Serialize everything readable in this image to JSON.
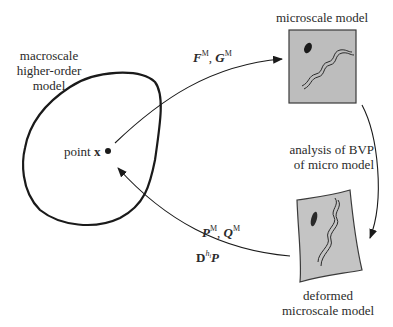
{
  "diagram": {
    "macro": {
      "label_lines": [
        "macroscale",
        "higher-order",
        "model"
      ],
      "point_label_prefix": "point ",
      "point_label_var": "x"
    },
    "micro": {
      "label": "microscale model",
      "fill_color": "#bdbdbd"
    },
    "deformed": {
      "label_lines": [
        "deformed",
        "microscale model"
      ],
      "fill_color": "#c4c4c4"
    },
    "arrows": {
      "downscale": {
        "var1": "F",
        "sup1": "M",
        "sep": ", ",
        "var2": "G",
        "sup2": "M"
      },
      "analysis": {
        "label_lines": [
          "analysis of BVP",
          "of micro model"
        ]
      },
      "upscale": {
        "var1": "P",
        "sup1": "M",
        "sep": ", ",
        "var2": "Q",
        "sup2": "M",
        "op": "D",
        "op_sup": "h",
        "op_sup_sub": "i",
        "op_var": "P"
      }
    },
    "colors": {
      "stroke": "#1a1a1a",
      "text": "#2a2a2a"
    }
  }
}
